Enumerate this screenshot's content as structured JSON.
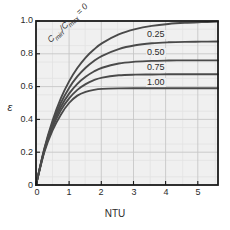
{
  "chart_data": {
    "type": "line",
    "title": "",
    "xlabel": "NTU",
    "ylabel": "ε",
    "xlim": [
      0,
      5.5
    ],
    "ylim": [
      0,
      1.0
    ],
    "xticks": [
      "0",
      "1",
      "2",
      "3",
      "4",
      "5"
    ],
    "xtick_values": [
      0,
      1,
      2,
      3,
      4,
      5
    ],
    "yticks": [
      "0",
      "0.2",
      "0.4",
      "0.6",
      "0.8",
      "1.0"
    ],
    "ytick_values": [
      0,
      0.2,
      0.4,
      0.6,
      0.8,
      1.0
    ],
    "grid": true,
    "grid_minor_x": 0.5,
    "grid_minor_y": 0.05,
    "legend_position": "inline-curve-labels",
    "annotations": [
      {
        "name": "ratio-zero",
        "text": "Cmin/Cmax = 0",
        "numerator": "C",
        "sub_min": "min",
        "sub_max": "max",
        "value": "0",
        "rotation_deg": -44
      }
    ],
    "series": [
      {
        "name": "Cmin/Cmax = 0",
        "label": "Cmin/Cmax = 0",
        "ratio": 0,
        "asymptote": 1.0,
        "x": [
          0,
          0.25,
          0.5,
          0.75,
          1.0,
          1.25,
          1.5,
          1.75,
          2.0,
          2.5,
          3.0,
          3.5,
          4.0,
          4.5,
          5.0,
          5.5
        ],
        "y": [
          0,
          0.221,
          0.393,
          0.528,
          0.632,
          0.713,
          0.777,
          0.826,
          0.865,
          0.918,
          0.95,
          0.97,
          0.982,
          0.989,
          0.993,
          0.996
        ]
      },
      {
        "name": "Cmin/Cmax = 0.25",
        "label": "0.25",
        "ratio": 0.25,
        "asymptote": 0.875,
        "x": [
          0,
          0.25,
          0.5,
          0.75,
          1.0,
          1.25,
          1.5,
          1.75,
          2.0,
          2.5,
          3.0,
          3.5,
          4.0,
          4.5,
          5.0,
          5.5
        ],
        "y": [
          0,
          0.216,
          0.378,
          0.5,
          0.592,
          0.662,
          0.715,
          0.756,
          0.788,
          0.829,
          0.852,
          0.864,
          0.87,
          0.873,
          0.874,
          0.875
        ]
      },
      {
        "name": "Cmin/Cmax = 0.50",
        "label": "0.50",
        "ratio": 0.5,
        "asymptote": 0.76,
        "x": [
          0,
          0.25,
          0.5,
          0.75,
          1.0,
          1.25,
          1.5,
          1.75,
          2.0,
          2.5,
          3.0,
          3.5,
          4.0,
          4.5,
          5.0,
          5.5
        ],
        "y": [
          0,
          0.211,
          0.364,
          0.476,
          0.557,
          0.617,
          0.66,
          0.692,
          0.715,
          0.741,
          0.752,
          0.757,
          0.759,
          0.76,
          0.76,
          0.76
        ]
      },
      {
        "name": "Cmin/Cmax = 0.75",
        "label": "0.75",
        "ratio": 0.75,
        "asymptote": 0.675,
        "x": [
          0,
          0.25,
          0.5,
          0.75,
          1.0,
          1.25,
          1.5,
          1.75,
          2.0,
          2.5,
          3.0,
          3.5,
          4.0,
          4.5,
          5.0,
          5.5
        ],
        "y": [
          0,
          0.207,
          0.351,
          0.455,
          0.528,
          0.58,
          0.615,
          0.639,
          0.655,
          0.669,
          0.673,
          0.674,
          0.675,
          0.675,
          0.675,
          0.675
        ]
      },
      {
        "name": "Cmin/Cmax = 1.00",
        "label": "1.00",
        "ratio": 1.0,
        "asymptote": 0.59,
        "x": [
          0,
          0.25,
          0.5,
          0.75,
          1.0,
          1.25,
          1.5,
          1.75,
          2.0,
          2.5,
          3.0,
          3.5,
          4.0,
          4.5,
          5.0,
          5.5
        ],
        "y": [
          0,
          0.2,
          0.333,
          0.429,
          0.5,
          0.545,
          0.568,
          0.58,
          0.586,
          0.589,
          0.59,
          0.59,
          0.59,
          0.59,
          0.59,
          0.59
        ]
      }
    ],
    "curve_labels": [
      {
        "text": "0.25",
        "x_px": 146,
        "y_px": 34
      },
      {
        "text": "0.50",
        "x_px": 146,
        "y_px": 52
      },
      {
        "text": "0.75",
        "x_px": 146,
        "y_px": 67
      },
      {
        "text": "1.00",
        "x_px": 146,
        "y_px": 82
      }
    ],
    "colors": {
      "curve": "#4a4a4a",
      "frame": "#1a1a1a",
      "grid_major": "#c9c9c9",
      "grid_minor": "#dedede",
      "plot_background": "#f0f0f0",
      "figure_background": "#ffffff",
      "text": "#2b2b2b"
    }
  }
}
